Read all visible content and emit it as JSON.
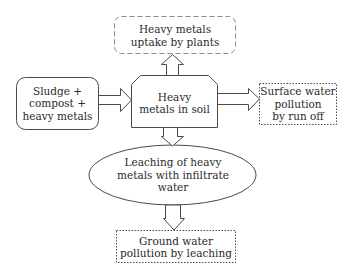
{
  "diagram": {
    "type": "flowchart",
    "colors": {
      "stroke": "#4a4a4a",
      "text": "#2a2a2a",
      "background": "#ffffff"
    },
    "nodes": {
      "uptake": {
        "shape": "dashed-rounded-rectangle",
        "lines": [
          "Heavy metals",
          "uptake by plants"
        ]
      },
      "source": {
        "shape": "rounded-rectangle",
        "lines": [
          "Sludge +",
          "compost +",
          "heavy metals"
        ]
      },
      "soil": {
        "shape": "chamfered-rectangle",
        "lines": [
          "Heavy",
          "metals in soil"
        ]
      },
      "surface": {
        "shape": "dotted-rectangle",
        "lines": [
          "Surface water",
          "pollution",
          "by run off"
        ]
      },
      "leaching": {
        "shape": "ellipse",
        "lines": [
          "Leaching of heavy",
          "metals with infiltrate",
          "water"
        ]
      },
      "ground": {
        "shape": "dotted-rectangle",
        "lines": [
          "Ground water",
          "pollution by leaching"
        ]
      }
    },
    "edges": [
      {
        "from": "source",
        "to": "soil",
        "style": "hollow-block-arrow"
      },
      {
        "from": "soil",
        "to": "uptake",
        "style": "hollow-block-arrow"
      },
      {
        "from": "soil",
        "to": "surface",
        "style": "hollow-block-arrow"
      },
      {
        "from": "soil",
        "to": "leaching",
        "style": "hollow-block-arrow"
      },
      {
        "from": "leaching",
        "to": "ground",
        "style": "hollow-block-arrow"
      }
    ]
  }
}
